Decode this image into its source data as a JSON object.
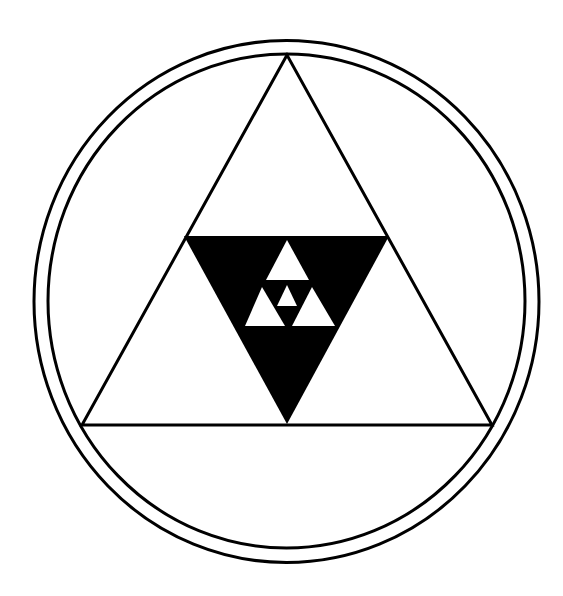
{
  "diagram": {
    "title": "",
    "background": "#ffffff",
    "ink": "#000000",
    "outer_ring": {
      "cx": 286.5,
      "cy": 301.5,
      "rx": 252.5,
      "ry": 261,
      "stroke_width": 3
    },
    "inner_ring": {
      "cx": 286.5,
      "cy": 301,
      "rx": 238.5,
      "ry": 247,
      "stroke_width": 3
    },
    "outer_triangle": {
      "points": "287,55 82,425 492,425",
      "stroke_width": 3
    },
    "black_inverted_triangle": {
      "points": "184,236 389,236 287,424"
    },
    "white_triangles": [
      {
        "name": "top",
        "points": "287,240 266,280 309,280"
      },
      {
        "name": "left",
        "points": "262,287 245,326 285,326"
      },
      {
        "name": "right",
        "points": "312,287 292,326 335,326"
      },
      {
        "name": "center-small",
        "points": "287,285 277,306 297,306"
      }
    ]
  }
}
